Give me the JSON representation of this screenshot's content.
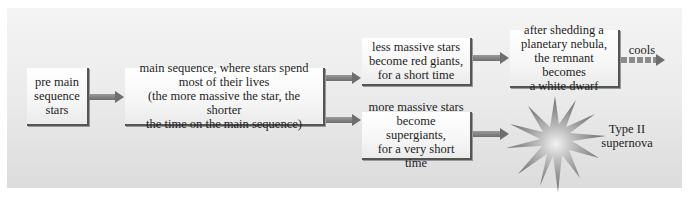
{
  "diagram": {
    "nodes": {
      "pre_main_sequence": "pre main\nsequence\nstars",
      "main_sequence": "main sequence, where stars spend\nmost of their lives\n(the more massive the star, the shorter\nthe time on the main sequence)",
      "less_massive": "less massive stars\nbecome red giants,\nfor a short time",
      "more_massive": "more massive stars\nbecome supergiants,\nfor a very short time",
      "white_dwarf": "after shedding a\nplanetary nebula,\nthe remnant becomes\na white dwarf"
    },
    "labels": {
      "cools": "cools",
      "supernova": "Type II\nsupernova"
    },
    "icons": {
      "supernova": "starburst-icon"
    },
    "colors": {
      "panel_top": "#f4f4f4",
      "panel_bottom": "#dcdcdc",
      "arrow": "#6e6e6e",
      "box_border": "#555555"
    }
  }
}
